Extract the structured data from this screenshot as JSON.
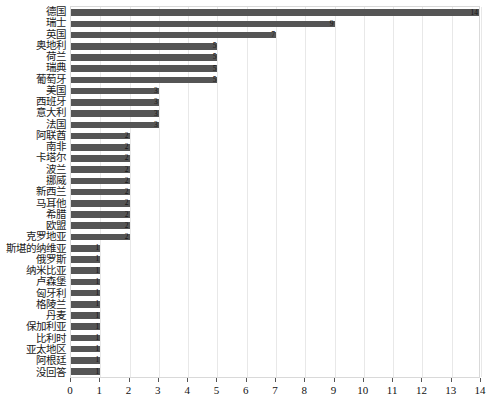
{
  "chart_data": {
    "type": "bar",
    "orientation": "horizontal",
    "title": "",
    "xlabel": "",
    "ylabel": "",
    "xlim": [
      0,
      14
    ],
    "xticks": [
      0,
      1,
      2,
      3,
      4,
      5,
      6,
      7,
      8,
      9,
      10,
      11,
      12,
      13,
      14
    ],
    "grid": true,
    "legend": false,
    "bar_color": "#555555",
    "categories": [
      "德国",
      "瑞士",
      "英国",
      "奥地利",
      "荷兰",
      "瑞典",
      "葡萄牙",
      "美国",
      "西班牙",
      "意大利",
      "法国",
      "阿联酋",
      "南非",
      "卡塔尔",
      "波兰",
      "挪威",
      "新西兰",
      "马耳他",
      "希腊",
      "欧盟",
      "克罗地亚",
      "斯堪的纳维亚",
      "俄罗斯",
      "纳米比亚",
      "卢森堡",
      "匈牙利",
      "格陵兰",
      "丹麦",
      "保加利亚",
      "比利时",
      "亚太地区",
      "阿根廷",
      "没回答"
    ],
    "values": [
      14,
      9,
      7,
      5,
      5,
      5,
      5,
      3,
      3,
      3,
      3,
      2,
      2,
      2,
      2,
      2,
      2,
      2,
      2,
      2,
      2,
      1,
      1,
      1,
      1,
      1,
      1,
      1,
      1,
      1,
      1,
      1,
      1
    ],
    "value_labels": [
      "14",
      "9",
      "7",
      "5",
      "5",
      "5",
      "5",
      "3",
      "3",
      "3",
      "3",
      "2",
      "2",
      "2",
      "2",
      "2",
      "2",
      "2",
      "2",
      "2",
      "2",
      "1",
      "1",
      "1",
      "1",
      "1",
      "1",
      "1",
      "1",
      "1",
      "1",
      "1",
      "1"
    ]
  }
}
